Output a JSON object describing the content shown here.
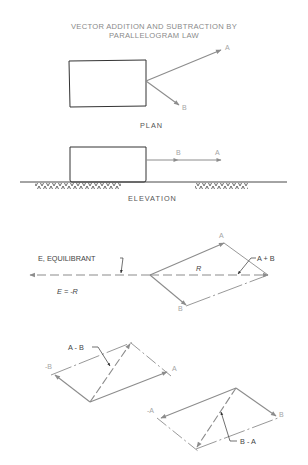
{
  "title": {
    "line1": "VECTOR ADDITION AND SUBTRACTION BY",
    "line2": "PARALLELOGRAM LAW"
  },
  "plan": {
    "caption": "PLAN",
    "vector_a_label": "A",
    "vector_b_label": "B"
  },
  "elevation": {
    "caption": "ELEVATION",
    "vector_a_label": "A",
    "vector_b_label": "B"
  },
  "addition": {
    "vector_a_label": "A",
    "vector_b_label": "B",
    "resultant_label": "R",
    "sum_label": "A + B",
    "equilibrant_label": "E, EQUILIBRANT",
    "equation": "E = -R"
  },
  "subtraction_a_minus_b": {
    "diff_label": "A - B",
    "neg_b_label": "-B",
    "vector_a_label": "A"
  },
  "subtraction_b_minus_a": {
    "diff_label": "B - A",
    "neg_a_label": "-A",
    "vector_b_label": "B"
  },
  "colors": {
    "outline": "#333333",
    "vector": "#8c8c8c",
    "label": "#a5a5a5",
    "note": "#444444"
  }
}
